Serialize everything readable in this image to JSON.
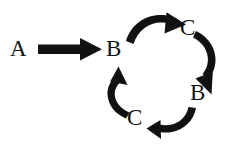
{
  "diagram": {
    "type": "reaction-cycle",
    "background_color": "#ffffff",
    "ink_color": "#111111",
    "nodes": [
      {
        "id": "a",
        "label": "A",
        "role": "reactant",
        "x": 20,
        "y": 48
      },
      {
        "id": "b1",
        "label": "B",
        "role": "cycle-member",
        "x": 116,
        "y": 48
      },
      {
        "id": "c1",
        "label": "C",
        "role": "cycle-member",
        "x": 190,
        "y": 27
      },
      {
        "id": "b2",
        "label": "B",
        "role": "cycle-member",
        "x": 200,
        "y": 92
      },
      {
        "id": "c2",
        "label": "C",
        "role": "cycle-member",
        "x": 137,
        "y": 117
      }
    ],
    "arrows": [
      {
        "id": "arrow-a-to-b",
        "from": "a",
        "to": "b1",
        "style": "straight",
        "direction": "right"
      },
      {
        "id": "arrow-b1-to-c1",
        "from": "b1",
        "to": "c1",
        "style": "curved",
        "direction": "clockwise-top"
      },
      {
        "id": "arrow-c1-to-b2",
        "from": "c1",
        "to": "b2",
        "style": "curved",
        "direction": "clockwise-right"
      },
      {
        "id": "arrow-b2-to-c2",
        "from": "b2",
        "to": "c2",
        "style": "curved",
        "direction": "clockwise-bottom"
      },
      {
        "id": "arrow-c2-to-b1",
        "from": "c2",
        "to": "b1",
        "style": "curved",
        "direction": "clockwise-left"
      }
    ]
  }
}
